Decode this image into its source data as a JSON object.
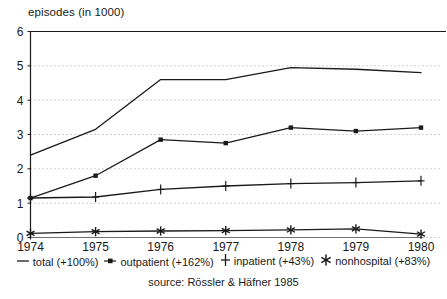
{
  "chart_data": {
    "type": "line",
    "title": "",
    "ylabel": "episodes (in 1000)",
    "xlabel": "",
    "categories": [
      "1974",
      "1975",
      "1976",
      "1977",
      "1978",
      "1979",
      "1980"
    ],
    "x": [
      1974,
      1975,
      1976,
      1977,
      1978,
      1979,
      1980
    ],
    "ylim": [
      0,
      6
    ],
    "yticks": [
      0,
      1,
      2,
      3,
      4,
      5,
      6
    ],
    "ytick_labels": [
      "0",
      "1",
      "2",
      "3",
      "4",
      "5",
      "6"
    ],
    "grid": "horizontal-dotted",
    "legend_position": "bottom",
    "source": "source: Rössler & Häfner 1985",
    "series": [
      {
        "name": "total (+100%)",
        "short_name": "total",
        "change": "+100%",
        "marker": "dash",
        "values": [
          2.4,
          3.15,
          4.6,
          4.6,
          4.95,
          4.9,
          4.8
        ]
      },
      {
        "name": "outpatient (+162%)",
        "short_name": "outpatient",
        "change": "+162%",
        "marker": "square",
        "values": [
          1.15,
          1.8,
          2.85,
          2.75,
          3.2,
          3.1,
          3.2
        ]
      },
      {
        "name": "inpatient (+43%)",
        "short_name": "inpatient",
        "change": "+43%",
        "marker": "plus",
        "values": [
          1.15,
          1.18,
          1.4,
          1.5,
          1.57,
          1.6,
          1.65
        ]
      },
      {
        "name": "nonhospital (+83%)",
        "short_name": "nonhospital",
        "change": "+83%",
        "marker": "asterisk",
        "values": [
          0.12,
          0.17,
          0.19,
          0.2,
          0.22,
          0.25,
          0.1
        ]
      }
    ]
  },
  "axis": {
    "y_title": "episodes (in 1000)"
  },
  "legend": {
    "items": [
      {
        "label": "total (+100%)",
        "marker": "dash"
      },
      {
        "label": "outpatient (+162%)",
        "marker": "square"
      },
      {
        "label": "inpatient (+43%)",
        "marker": "plus"
      },
      {
        "label": "nonhospital (+83%)",
        "marker": "asterisk"
      }
    ]
  },
  "footer": {
    "source": "source: Rössler & Häfner 1985"
  },
  "colors": {
    "line": "#1a1a1a",
    "grid": "#9a9a9a",
    "axis": "#1a1a1a",
    "background": "#ffffff"
  }
}
